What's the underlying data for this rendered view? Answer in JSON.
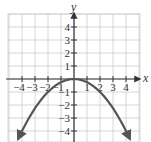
{
  "chart_data": {
    "type": "line",
    "title": "",
    "xlabel": "x",
    "ylabel": "y",
    "xlim": [
      -4.5,
      4.5
    ],
    "ylim": [
      -4.5,
      4.5
    ],
    "grid": true,
    "x_ticks": [
      -4,
      -3,
      -2,
      -1,
      1,
      2,
      3,
      4
    ],
    "y_ticks": [
      4,
      3,
      2,
      1,
      -1,
      -2,
      -3,
      -4
    ],
    "x_tick_labels": [
      "−4",
      "−3",
      "−2",
      "−1",
      "1",
      "2",
      "3",
      "4"
    ],
    "y_tick_labels": [
      "4",
      "3",
      "2",
      "1",
      "−1",
      "−2",
      "−3",
      "−4"
    ],
    "series": [
      {
        "name": "parabola",
        "equation": "y = -x^2/4",
        "x": [
          -4.3,
          -4,
          -3,
          -2,
          -1,
          0,
          1,
          2,
          3,
          4,
          4.3
        ],
        "y": [
          -4.62,
          -4,
          -2.25,
          -1,
          -0.25,
          0,
          -0.25,
          -1,
          -2.25,
          -4,
          -4.62
        ],
        "arrows_at_ends": true
      }
    ],
    "colors": {
      "curve": "#555555",
      "axis": "#333333",
      "grid": "#cccccc"
    }
  }
}
